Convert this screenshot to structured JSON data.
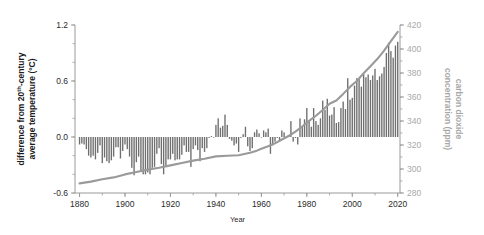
{
  "chart_data": {
    "type": "bar",
    "title": "",
    "subtitle": "",
    "xlabel": "Year",
    "ylabel": "difference from 20th-century average temperature (°C)",
    "ylabel_line1": "difference from 20",
    "ylabel_sup": "th",
    "ylabel_line1b": "-century",
    "ylabel_line2": "average temperature (°C)",
    "ylabel_right": "carbon dioxide concentration (ppm)",
    "ylabel_right_line1": "carbon dioxide",
    "ylabel_right_line2": "concentration (ppm)",
    "xlim": [
      1878,
      2021
    ],
    "ylim": [
      -0.6,
      1.2
    ],
    "ylim_right": [
      280,
      420
    ],
    "grid": false,
    "legend": "none",
    "xticks": [
      1880,
      1900,
      1920,
      1940,
      1960,
      1980,
      2000,
      2020
    ],
    "xtick_labels": [
      "1880",
      "1900",
      "1920",
      "1940",
      "1960",
      "1980",
      "2000",
      "2020"
    ],
    "xminor_step": 10,
    "yticks": [
      -0.6,
      0.0,
      0.6,
      1.2
    ],
    "ytick_labels": [
      "-0.6",
      "0.0",
      "0.6",
      "1.2"
    ],
    "yminor_step": 0.2,
    "yticks_right": [
      280,
      300,
      320,
      340,
      360,
      380,
      400,
      420
    ],
    "ytick_labels_right": [
      "280",
      "300",
      "320",
      "340",
      "360",
      "380",
      "400",
      "420"
    ],
    "yminor_step_right": 10,
    "colors": {
      "bar": "#6f6f6f",
      "line": "#9a9a9a",
      "axis": "#9a9a9a",
      "text": "#262626",
      "text_right": "#a8a8a8",
      "background": "#ffffff"
    },
    "series": [
      {
        "name": "difference from 20th-century average temperature",
        "type": "bar",
        "axis": "left",
        "unit": "°C",
        "x": [
          1880,
          1881,
          1882,
          1883,
          1884,
          1885,
          1886,
          1887,
          1888,
          1889,
          1890,
          1891,
          1892,
          1893,
          1894,
          1895,
          1896,
          1897,
          1898,
          1899,
          1900,
          1901,
          1902,
          1903,
          1904,
          1905,
          1906,
          1907,
          1908,
          1909,
          1910,
          1911,
          1912,
          1913,
          1914,
          1915,
          1916,
          1917,
          1918,
          1919,
          1920,
          1921,
          1922,
          1923,
          1924,
          1925,
          1926,
          1927,
          1928,
          1929,
          1930,
          1931,
          1932,
          1933,
          1934,
          1935,
          1936,
          1937,
          1938,
          1939,
          1940,
          1941,
          1942,
          1943,
          1944,
          1945,
          1946,
          1947,
          1948,
          1949,
          1950,
          1951,
          1952,
          1953,
          1954,
          1955,
          1956,
          1957,
          1958,
          1959,
          1960,
          1961,
          1962,
          1963,
          1964,
          1965,
          1966,
          1967,
          1968,
          1969,
          1970,
          1971,
          1972,
          1973,
          1974,
          1975,
          1976,
          1977,
          1978,
          1979,
          1980,
          1981,
          1982,
          1983,
          1984,
          1985,
          1986,
          1987,
          1988,
          1989,
          1990,
          1991,
          1992,
          1993,
          1994,
          1995,
          1996,
          1997,
          1998,
          1999,
          2000,
          2001,
          2002,
          2003,
          2004,
          2005,
          2006,
          2007,
          2008,
          2009,
          2010,
          2011,
          2012,
          2013,
          2014,
          2015,
          2016,
          2017,
          2018,
          2019,
          2020
        ],
        "values": [
          -0.08,
          -0.07,
          -0.08,
          -0.13,
          -0.2,
          -0.22,
          -0.2,
          -0.24,
          -0.17,
          -0.09,
          -0.28,
          -0.22,
          -0.26,
          -0.28,
          -0.25,
          -0.21,
          -0.11,
          -0.11,
          -0.23,
          -0.15,
          -0.08,
          -0.13,
          -0.21,
          -0.33,
          -0.41,
          -0.27,
          -0.21,
          -0.36,
          -0.4,
          -0.4,
          -0.38,
          -0.4,
          -0.33,
          -0.32,
          -0.18,
          -0.12,
          -0.29,
          -0.4,
          -0.31,
          -0.24,
          -0.24,
          -0.18,
          -0.25,
          -0.24,
          -0.24,
          -0.19,
          -0.09,
          -0.16,
          -0.16,
          -0.32,
          -0.13,
          -0.09,
          -0.14,
          -0.26,
          -0.12,
          -0.16,
          -0.12,
          -0.01,
          0.01,
          0.0,
          0.13,
          0.2,
          0.1,
          0.12,
          0.24,
          0.13,
          -0.02,
          -0.04,
          -0.09,
          -0.07,
          -0.16,
          -0.01,
          0.03,
          0.11,
          -0.1,
          -0.15,
          -0.12,
          0.05,
          0.08,
          0.04,
          0.0,
          0.07,
          0.05,
          0.09,
          -0.18,
          -0.09,
          -0.05,
          -0.01,
          -0.05,
          0.07,
          0.05,
          -0.01,
          0.02,
          0.17,
          -0.05,
          -0.01,
          -0.08,
          0.2,
          0.11,
          0.19,
          0.31,
          0.18,
          0.11,
          0.31,
          0.17,
          0.13,
          0.2,
          0.39,
          0.29,
          0.41,
          0.23,
          0.24,
          0.32,
          0.15,
          0.16,
          0.31,
          0.38,
          0.3,
          0.63,
          0.4,
          0.42,
          0.55,
          0.63,
          0.62,
          0.54,
          0.68,
          0.64,
          0.67,
          0.61,
          0.66,
          0.73,
          0.61,
          0.65,
          0.68,
          0.75,
          0.9,
          1.01,
          0.92,
          0.85,
          0.98,
          1.02
        ]
      },
      {
        "name": "carbon dioxide concentration",
        "type": "line",
        "axis": "right",
        "unit": "ppm",
        "x": [
          1880,
          1885,
          1890,
          1895,
          1900,
          1905,
          1910,
          1915,
          1920,
          1925,
          1930,
          1935,
          1940,
          1945,
          1950,
          1955,
          1958,
          1960,
          1963,
          1966,
          1969,
          1972,
          1975,
          1978,
          1981,
          1984,
          1987,
          1990,
          1993,
          1996,
          1999,
          2002,
          2005,
          2008,
          2011,
          2014,
          2017,
          2020
        ],
        "values": [
          288.0,
          289.5,
          291.5,
          293.0,
          295.5,
          297.5,
          299.5,
          301.0,
          303.0,
          305.0,
          307.0,
          308.5,
          310.5,
          311.0,
          311.5,
          313.5,
          315.3,
          316.9,
          319.0,
          321.4,
          324.6,
          327.5,
          331.1,
          335.4,
          340.1,
          344.4,
          349.2,
          354.4,
          357.1,
          362.6,
          368.4,
          373.3,
          379.8,
          385.6,
          391.6,
          398.6,
          406.6,
          414.2
        ]
      }
    ]
  }
}
